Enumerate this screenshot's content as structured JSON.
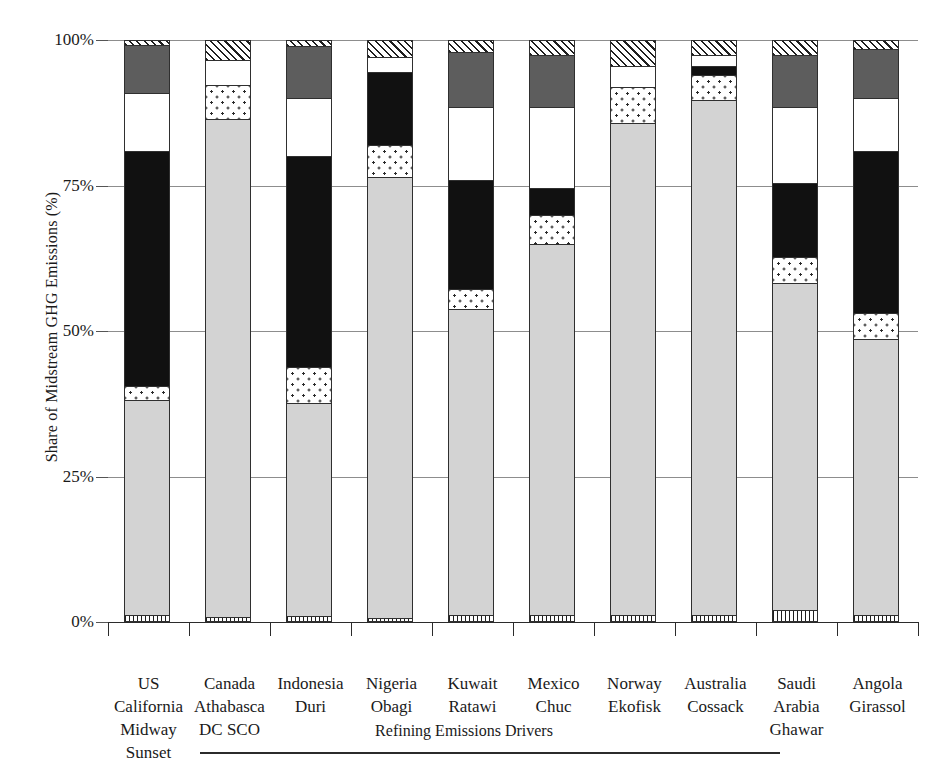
{
  "chart_data": {
    "type": "bar",
    "subtype": "stacked-bar-100-percent",
    "title": "",
    "xlabel": "",
    "ylabel": "Share of Midstream GHG Emissions (%)",
    "ylim": [
      0,
      100
    ],
    "ytick_labels": [
      "0%",
      "25%",
      "50%",
      "75%",
      "100%"
    ],
    "ytick_values": [
      0,
      25,
      50,
      75,
      100
    ],
    "grid": true,
    "legend": "none",
    "categories": [
      "US California Midway Sunset",
      "Canada Athabasca DC SCO",
      "Indonesia Duri",
      "Nigeria Obagi",
      "Kuwait Ratawi",
      "Mexico Chuc",
      "Norway Ekofisk",
      "Australia Cossack",
      "Saudi Arabia Ghawar",
      "Angola Girassol"
    ],
    "category_lines": [
      [
        "US",
        "California",
        "Midway",
        "Sunset"
      ],
      [
        "Canada",
        "Athabasca",
        "DC SCO"
      ],
      [
        "Indonesia",
        "Duri"
      ],
      [
        "Nigeria",
        "Obagi"
      ],
      [
        "Kuwait",
        "Ratawi"
      ],
      [
        "Mexico",
        "Chuc"
      ],
      [
        "Norway",
        "Ekofisk"
      ],
      [
        "Australia",
        "Cossack"
      ],
      [
        "Saudi",
        "Arabia",
        "Ghawar"
      ],
      [
        "Angola",
        "Girassol"
      ]
    ],
    "series": [
      {
        "name": "vertical-hatch-base",
        "fill": "vhatch",
        "values": [
          1.2,
          0.8,
          1.0,
          0.7,
          1.2,
          1.2,
          1.2,
          1.2,
          2.0,
          1.2
        ]
      },
      {
        "name": "light-gray",
        "fill": "lightgray",
        "values": [
          37.0,
          85.7,
          36.7,
          75.8,
          52.5,
          63.8,
          84.5,
          88.5,
          56.2,
          47.4
        ]
      },
      {
        "name": "dotted",
        "fill": "dotted",
        "values": [
          2.4,
          5.8,
          6.1,
          5.4,
          3.5,
          5.0,
          6.3,
          4.3,
          4.6,
          4.5
        ]
      },
      {
        "name": "black",
        "fill": "black",
        "values": [
          40.4,
          0.0,
          36.2,
          12.6,
          18.8,
          4.5,
          0.0,
          1.5,
          12.7,
          27.9
        ]
      },
      {
        "name": "white",
        "fill": "white",
        "values": [
          9.9,
          4.2,
          10.0,
          2.5,
          12.5,
          14.0,
          3.5,
          2.0,
          13.0,
          9.0
        ]
      },
      {
        "name": "dark-gray",
        "fill": "darkgray",
        "values": [
          8.2,
          0.0,
          9.0,
          0.0,
          9.5,
          9.0,
          0.0,
          0.0,
          9.0,
          8.5
        ]
      },
      {
        "name": "diagonal-hatch-top",
        "fill": "hatch",
        "values": [
          0.9,
          3.5,
          1.0,
          3.0,
          2.0,
          2.5,
          4.5,
          2.5,
          2.5,
          1.5
        ]
      }
    ],
    "bottom_annotation": "Refining Emissions Drivers"
  }
}
